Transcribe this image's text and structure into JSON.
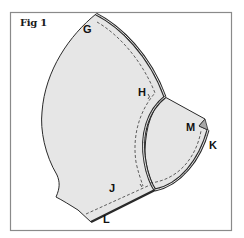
{
  "figure": {
    "title": "Fig 1",
    "labels": {
      "g": "G",
      "h": "H",
      "m": "M",
      "k": "K",
      "j": "J",
      "l": "L"
    }
  },
  "colors": {
    "background": "#ffffff",
    "frame": "#8a8a8a",
    "fabric_fill": "#e6e6e6",
    "outline": "#2a2a2a",
    "fold_fill": "#a8a8a8",
    "dashed": "#3a3a3a"
  }
}
